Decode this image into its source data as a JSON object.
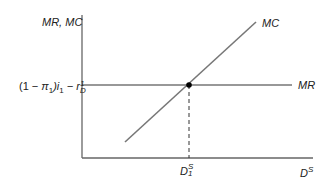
{
  "diagram": {
    "y_axis_label": "MR, MC",
    "x_axis_label": "D",
    "x_axis_label_sup": "S",
    "mr_level_label_prefix": "(1 − ",
    "mr_level_label_pi": "π",
    "mr_level_label_pi_sub": "1",
    "mr_level_label_mid": ")i",
    "mr_level_label_i_sub": "1",
    "mr_level_label_minus": " − r",
    "mr_level_label_r_sub": "D",
    "mr_level_label_r_sup": "1",
    "mr_curve_label": "MR",
    "mc_curve_label": "MC",
    "equilibrium_label": "D",
    "equilibrium_label_sup": "S",
    "equilibrium_label_sub": "1",
    "colors": {
      "axis": "#555555",
      "mr_line": "#333333",
      "mc_line": "#777777",
      "point": "#000000"
    }
  }
}
